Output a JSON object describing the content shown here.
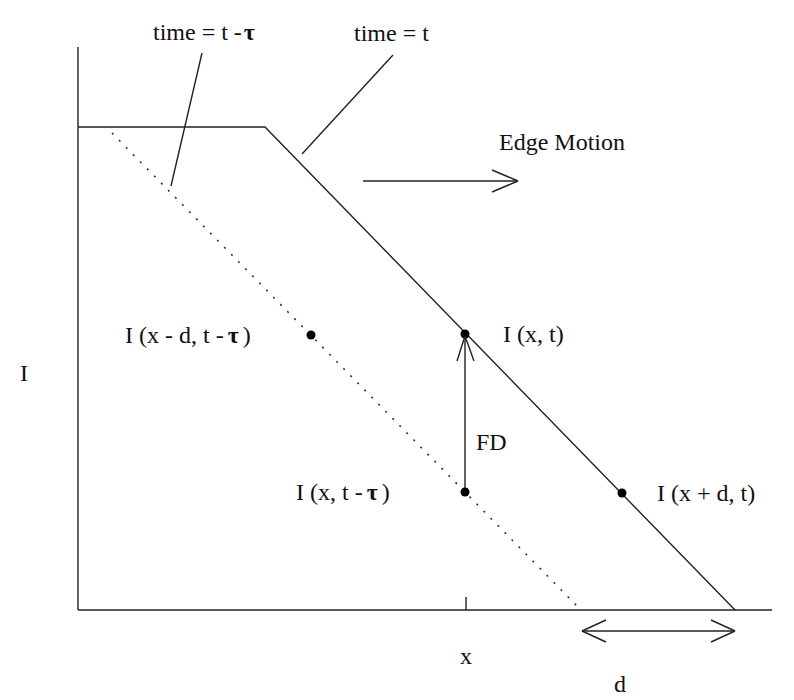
{
  "diagram": {
    "title_labels": {
      "prev_time": "time = t -",
      "prev_time_tau": "τ",
      "curr_time": "time = t"
    },
    "edge_motion_label": "Edge Motion",
    "y_axis_label": "I",
    "x_axis_label": "x",
    "displacement_label": "d",
    "frame_difference_label": "FD",
    "points": [
      {
        "id": "prev_shifted",
        "label_prefix": "I (x - d, t -",
        "label_tau": "τ",
        "label_suffix": ")"
      },
      {
        "id": "current",
        "label": "I (x, t)"
      },
      {
        "id": "prev_same_x",
        "label_prefix": "I (x, t -",
        "label_tau": "τ",
        "label_suffix": ")"
      },
      {
        "id": "current_shifted",
        "label": "I (x + d, t)"
      }
    ],
    "colors": {
      "line": "#222222",
      "text": "#111111",
      "background": "#ffffff"
    }
  }
}
